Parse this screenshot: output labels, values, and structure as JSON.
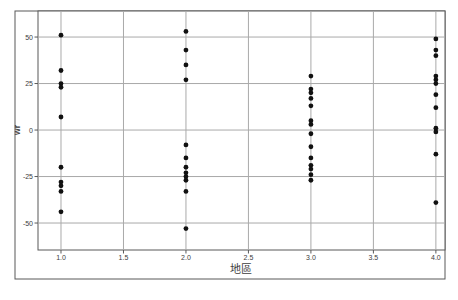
{
  "chart": {
    "x_axis_title": "地區",
    "y_axis_title": "wr",
    "x_tick_labels": [
      "1.0",
      "1.5",
      "2.0",
      "2.5",
      "3.0",
      "3.5",
      "4.0"
    ],
    "y_tick_labels": [
      "50",
      "25",
      "0",
      "-25",
      "-50"
    ]
  },
  "chart_data": {
    "type": "scatter",
    "title": "",
    "xlabel": "地區",
    "ylabel": "wr",
    "xlim": [
      0.816,
      4.073
    ],
    "ylim": [
      -64.5,
      64
    ],
    "x_tick_values": [
      1.0,
      1.5,
      2.0,
      2.5,
      3.0,
      3.5,
      4.0
    ],
    "y_tick_values": [
      50,
      25,
      0,
      -25,
      -50
    ],
    "grid": true,
    "legend": "none",
    "series": [
      {
        "name": "observations",
        "x": [
          1,
          1,
          1,
          1,
          1,
          1,
          1,
          1,
          1,
          1,
          2,
          2,
          2,
          2,
          2,
          2,
          2,
          2,
          2,
          2,
          2,
          2,
          3,
          3,
          3,
          3,
          3,
          3,
          3,
          3,
          3,
          3,
          3,
          3,
          3,
          3,
          4,
          4,
          4,
          4,
          4,
          4,
          4,
          4,
          4,
          4,
          4,
          4
        ],
        "y": [
          51,
          32,
          25,
          23,
          7,
          -20,
          -28,
          -30,
          -33,
          -44,
          53,
          43,
          35,
          27,
          -8,
          -15,
          -20,
          -23,
          -25,
          -27,
          -33,
          -53,
          29,
          22,
          20,
          17,
          13,
          5,
          3,
          -2,
          -9,
          -15,
          -19,
          -21,
          -24,
          -27,
          49,
          43,
          40,
          29,
          27,
          25,
          19,
          12,
          1,
          -1,
          -13,
          -39
        ]
      }
    ]
  },
  "colors": {
    "point": "#111111",
    "gridline": "#a9a9a9",
    "frame": "#595959",
    "tick_text": "#3d3d3d",
    "plot_background": "#ffffff"
  }
}
